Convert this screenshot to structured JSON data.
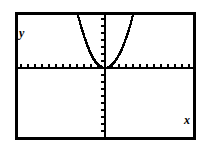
{
  "figure": {
    "title": "",
    "background_color": "#ffffff",
    "ink_color": "#000000",
    "frame": {
      "x": 15,
      "y": 12,
      "width": 181,
      "height": 128,
      "border_width": 3
    }
  },
  "labels": {
    "y_axis": "y",
    "x_axis": "x"
  },
  "chart_data": {
    "type": "line",
    "title": "",
    "subtitle": "",
    "xlabel": "x",
    "ylabel": "y",
    "grid": false,
    "legend": null,
    "style": "graphing-calculator-dotted",
    "axes": {
      "x_axis_pixel_y": 68,
      "y_axis_pixel_x": 105,
      "origin": [
        0,
        0
      ],
      "xlim": [
        -13,
        13
      ],
      "ylim": [
        -10,
        8
      ],
      "tick_spacing_x": 1,
      "tick_spacing_y": 1,
      "tick_pixel_spacing": 7,
      "tick_length": 4,
      "tick_count_x_left": 12,
      "tick_count_x_right": 13,
      "tick_count_y_above": 8,
      "tick_count_y_below": 10,
      "tick_labels_shown": false
    },
    "series": [
      {
        "name": "parabola",
        "equation": "y = a*x^2 (vertex at origin, opens upward)",
        "vertex": [
          0,
          0
        ],
        "opens": "up",
        "points": [
          [
            -3.9,
            7.6
          ],
          [
            -3.6,
            6.6
          ],
          [
            -3.3,
            5.5
          ],
          [
            -3.0,
            4.6
          ],
          [
            -2.7,
            3.7
          ],
          [
            -2.4,
            2.9
          ],
          [
            -2.1,
            2.2
          ],
          [
            -1.8,
            1.6
          ],
          [
            -1.5,
            1.1
          ],
          [
            -1.2,
            0.7
          ],
          [
            -0.9,
            0.4
          ],
          [
            -0.6,
            0.2
          ],
          [
            -0.3,
            0.05
          ],
          [
            0.0,
            0.0
          ],
          [
            0.3,
            0.05
          ],
          [
            0.6,
            0.2
          ],
          [
            0.9,
            0.4
          ],
          [
            1.2,
            0.7
          ],
          [
            1.6,
            1.2
          ],
          [
            2.0,
            1.9
          ],
          [
            2.4,
            2.7
          ],
          [
            2.8,
            3.7
          ],
          [
            3.2,
            4.8
          ],
          [
            3.6,
            6.1
          ],
          [
            4.0,
            7.6
          ]
        ]
      }
    ]
  }
}
